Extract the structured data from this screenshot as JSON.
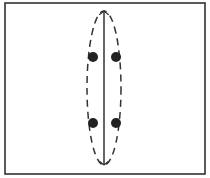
{
  "diagram": {
    "frame": {
      "x": 5,
      "y": 3,
      "width": 200,
      "height": 171,
      "stroke": "#333333"
    },
    "axis_arrow": {
      "x": 104,
      "y1": 11,
      "y2": 165,
      "style": "double-headed",
      "stroke": "#333333"
    },
    "ellipse": {
      "cx": 104,
      "cy": 88,
      "rx": 17,
      "ry": 77,
      "style": "dashed",
      "stroke": "#333333"
    },
    "dots": [
      {
        "cx": 93,
        "cy": 57,
        "r": 5
      },
      {
        "cx": 116,
        "cy": 57,
        "r": 5
      },
      {
        "cx": 93,
        "cy": 123,
        "r": 5
      },
      {
        "cx": 116,
        "cy": 123,
        "r": 5
      }
    ],
    "dot_color": "#222222"
  }
}
